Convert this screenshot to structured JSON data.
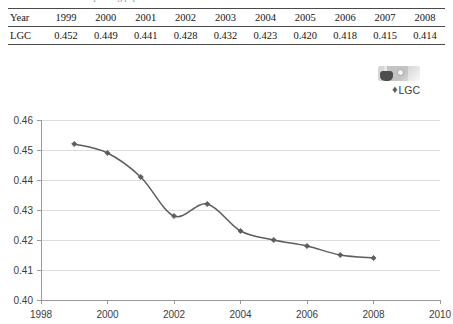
{
  "caption_sliver": "ratio for printing papers",
  "table": {
    "rows": [
      {
        "label": "Year",
        "values": [
          "1999",
          "2000",
          "2001",
          "2002",
          "2003",
          "2004",
          "2005",
          "2006",
          "2007",
          "2008"
        ]
      },
      {
        "label": "LGC",
        "values": [
          "0.452",
          "0.449",
          "0.441",
          "0.428",
          "0.432",
          "0.423",
          "0.420",
          "0.418",
          "0.415",
          "0.414"
        ]
      }
    ]
  },
  "legend": {
    "marker_glyph": "♦",
    "entries": [
      {
        "label": "LGC",
        "color": "#5d5d5d"
      }
    ],
    "artifact_name": "thumbnail-image-artifact"
  },
  "chart_data": {
    "type": "line",
    "title": "",
    "xlabel": "",
    "ylabel": "",
    "x": [
      1999,
      2000,
      2001,
      2002,
      2003,
      2004,
      2005,
      2006,
      2007,
      2008
    ],
    "series": [
      {
        "name": "LGC",
        "color": "#5d5d5d",
        "marker": "diamond",
        "smoothing": "spline",
        "values": [
          0.452,
          0.449,
          0.441,
          0.428,
          0.432,
          0.423,
          0.42,
          0.418,
          0.415,
          0.414
        ]
      }
    ],
    "xlim": [
      1998,
      2010
    ],
    "ylim": [
      0.4,
      0.46
    ],
    "xticks": [
      1998,
      2000,
      2002,
      2004,
      2006,
      2008,
      2010
    ],
    "xtick_labels": [
      "1998",
      "2000",
      "2002",
      "2004",
      "2006",
      "2008",
      "2010"
    ],
    "yticks": [
      0.4,
      0.41,
      0.42,
      0.43,
      0.44,
      0.45,
      0.46
    ],
    "ytick_labels": [
      "0.40",
      "0.41",
      "0.42",
      "0.43",
      "0.44",
      "0.45",
      "0.46"
    ],
    "grid": {
      "horizontal": true,
      "vertical": false,
      "color": "#dcdcdc"
    },
    "axis_color": "#9a9a9a",
    "legend_position": "top-right"
  }
}
